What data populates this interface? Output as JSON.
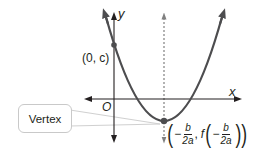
{
  "diagram": {
    "axes": {
      "x_label": "x",
      "y_label": "y",
      "origin_label": "O"
    },
    "points": {
      "y_intercept": {
        "label": "(0, c)"
      },
      "vertex": {
        "callout_label": "Vertex",
        "coord_open": "(",
        "coord_minus": "−",
        "coord_num": "b",
        "coord_den": "2a",
        "coord_comma": ",",
        "coord_f": "f",
        "coord_close": "))"
      }
    },
    "colors": {
      "curve": "#4d4d4f",
      "axes": "#231f20",
      "symmetry_line": "#808080",
      "callout_border": "#c9c9c9",
      "callout_wedge": "#d9d9d9"
    }
  }
}
